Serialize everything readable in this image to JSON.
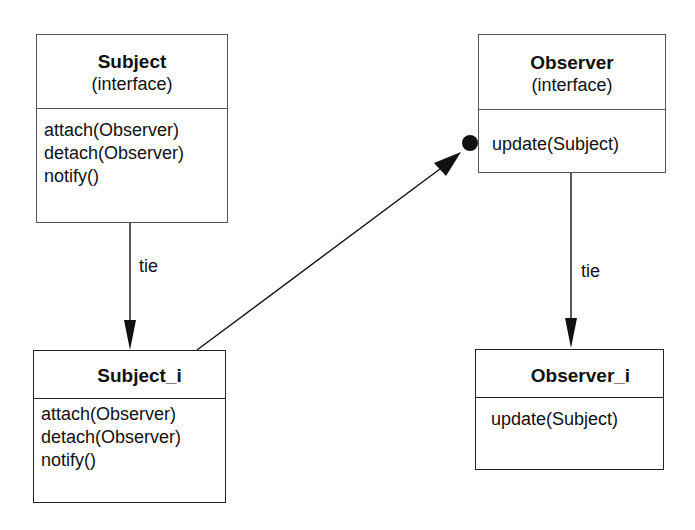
{
  "diagram": {
    "type": "uml-class-diagram",
    "classes": [
      {
        "id": "subject",
        "name": "Subject",
        "stereotype": "(interface)",
        "methods": [
          "attach(Observer)",
          "detach(Observer)",
          "notify()"
        ]
      },
      {
        "id": "observer",
        "name": "Observer",
        "stereotype": "(interface)",
        "methods": [
          "update(Subject)"
        ]
      },
      {
        "id": "subject_i",
        "name": "Subject_i",
        "methods": [
          "attach(Observer)",
          "detach(Observer)",
          "notify()"
        ]
      },
      {
        "id": "observer_i",
        "name": "Observer_i",
        "methods": [
          "update(Subject)"
        ]
      }
    ],
    "edges": [
      {
        "from": "Subject",
        "to": "Subject_i",
        "label": "tie",
        "arrow": "filled-triangle"
      },
      {
        "from": "Observer",
        "to": "Observer_i",
        "label": "tie",
        "arrow": "filled-triangle"
      },
      {
        "from": "Subject_i",
        "to": "Observer",
        "label": "",
        "arrow": "filled-triangle",
        "end_marker": "filled-dot"
      }
    ]
  },
  "colors": {
    "line": "#111111",
    "box_border": "#555555",
    "background": "#ffffff"
  }
}
